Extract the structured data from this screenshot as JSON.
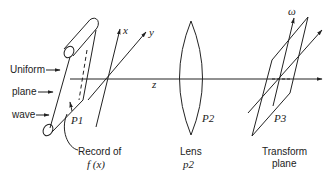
{
  "diagram": {
    "left_labels": [
      "Uniform",
      "plane",
      "wave"
    ],
    "axes": {
      "x": "x",
      "y": "y",
      "z": "z",
      "omega": "ω"
    },
    "planes": [
      {
        "id": "P1",
        "label": "P1",
        "caption_line1": "Record of",
        "caption_line2": "f (x)"
      },
      {
        "id": "P2",
        "label": "P2",
        "caption_line1": "Lens",
        "caption_line2": "p2"
      },
      {
        "id": "P3",
        "label": "P3",
        "caption_line1": "Transform",
        "caption_line2": "plane"
      }
    ]
  }
}
